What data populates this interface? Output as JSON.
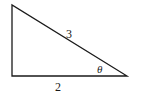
{
  "diagram": {
    "type": "right-triangle",
    "vertices": {
      "top_left": {
        "x": 12,
        "y": 5
      },
      "bottom_left": {
        "x": 12,
        "y": 76
      },
      "bottom_right": {
        "x": 127,
        "y": 76
      }
    },
    "labels": {
      "hypotenuse": "3",
      "base": "2",
      "angle": "θ"
    },
    "stroke_color": "#1a1a1a",
    "background": "#ffffff"
  }
}
